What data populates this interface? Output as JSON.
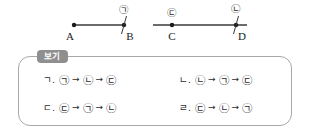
{
  "diagram": {
    "segments": [
      {
        "name": "segment-ab",
        "start_point_label": "A",
        "end_point_label": "B",
        "marker_at_end": "㉠",
        "marker_at_start": ""
      },
      {
        "name": "segment-cd",
        "start_point_label": "C",
        "end_point_label": "D",
        "marker_at_start": "㉢",
        "marker_at_end": "㉡"
      }
    ]
  },
  "options_box": {
    "tab_label": "보기",
    "options": [
      {
        "key": "ㄱ.",
        "step1": "㉠",
        "arrow1": "→",
        "step2": "㉡",
        "arrow2": "→",
        "step3": "㉢"
      },
      {
        "key": "ㄴ.",
        "step1": "㉡",
        "arrow1": "→",
        "step2": "㉠",
        "arrow2": "→",
        "step3": "㉢"
      },
      {
        "key": "ㄷ.",
        "step1": "㉢",
        "arrow1": "→",
        "step2": "㉠",
        "arrow2": "→",
        "step3": "㉡"
      },
      {
        "key": "ㄹ.",
        "step1": "㉢",
        "arrow1": "→",
        "step2": "㉡",
        "arrow2": "→",
        "step3": "㉠"
      }
    ]
  },
  "colors": {
    "line": "#3a3a3a",
    "box_border": "#a8a8a8",
    "tab_bg": "#8f8f8f",
    "text": "#1a1a1a"
  }
}
